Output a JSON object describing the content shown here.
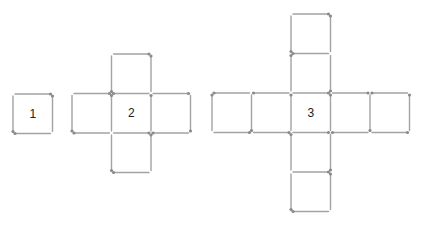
{
  "colors": {
    "stick": "#a3a3a3",
    "head": "#8a8a8a",
    "label": "#222222",
    "background": "#ffffff"
  },
  "unit": 39.5,
  "figures": [
    {
      "label": "1",
      "origin": [
        13,
        94
      ],
      "cells": [
        [
          0,
          0
        ]
      ],
      "label_cell": [
        0,
        0
      ]
    },
    {
      "label": "2",
      "origin": [
        72,
        54
      ],
      "cells": [
        [
          1,
          0
        ],
        [
          0,
          1
        ],
        [
          1,
          1
        ],
        [
          2,
          1
        ],
        [
          1,
          2
        ]
      ],
      "label_cell": [
        1,
        1
      ]
    },
    {
      "label": "3",
      "origin": [
        212,
        14
      ],
      "cells": [
        [
          2,
          0
        ],
        [
          2,
          1
        ],
        [
          0,
          2
        ],
        [
          1,
          2
        ],
        [
          2,
          2
        ],
        [
          3,
          2
        ],
        [
          4,
          2
        ],
        [
          2,
          3
        ],
        [
          2,
          4
        ]
      ],
      "label_cell": [
        2,
        2
      ]
    }
  ]
}
